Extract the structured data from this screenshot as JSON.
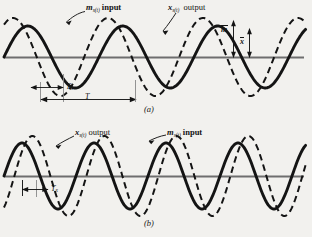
{
  "figure": {
    "background_color": "#f2f1ee",
    "ink_color": "#141414",
    "axis_color": "#6b6b6b",
    "panels": [
      {
        "id": "a",
        "caption": "(a)",
        "axis_y": 57,
        "labels": {
          "input": {
            "symbol": "m",
            "subscript": "s(t)",
            "word": "input"
          },
          "output": {
            "symbol": "x",
            "subscript": "s(t)",
            "word": "output"
          }
        },
        "measures": {
          "tx": {
            "symbol": "T",
            "subscript": "x"
          },
          "t": {
            "symbol": "T",
            "subscript": ""
          },
          "m_bar": "m",
          "x_bar": "x"
        },
        "waves": {
          "input_dashed": {
            "name": "m_s(t) input",
            "style": "dashed",
            "amplitude_px": 39,
            "period_px": 95,
            "phase_deg": 56,
            "stroke_width": 2.0
          },
          "output_solid": {
            "name": "x_s(t) output",
            "style": "solid",
            "amplitude_px": 31,
            "period_px": 95,
            "phase_deg": 0,
            "stroke_width": 2.9
          }
        }
      },
      {
        "id": "b",
        "caption": "(b)",
        "axis_y": 176,
        "labels": {
          "output": {
            "symbol": "x",
            "subscript": "s(t)",
            "word": "output"
          },
          "input": {
            "symbol": "m",
            "subscript": "s(t)",
            "word": "input"
          }
        },
        "measures": {
          "tx": {
            "symbol": "T",
            "subscript": "x"
          }
        },
        "waves": {
          "output_solid": {
            "name": "x_s(t) output",
            "style": "solid",
            "amplitude_px": 33,
            "period_px": 72,
            "phase_deg": 0,
            "stroke_width": 2.9
          },
          "input_dashed": {
            "name": "m_s(t) input",
            "style": "dashed",
            "amplitude_px": 40,
            "period_px": 72,
            "phase_deg": -52,
            "stroke_width": 2.0
          }
        }
      }
    ]
  },
  "text": {
    "a_input_sym": "m",
    "a_input_sub": "s(t)",
    "a_input_word": "input",
    "a_output_sym": "x",
    "a_output_sub": "s(t)",
    "a_output_word": "output",
    "a_tx_sym": "T",
    "a_tx_sub": "x",
    "a_t_sym": "T",
    "a_mbar": "m",
    "a_xbar": "x",
    "caption_a": "(a)",
    "b_output_sym": "x",
    "b_output_sub": "s(t)",
    "b_output_word": "output",
    "b_input_sym": "m",
    "b_input_sub": "s(t)",
    "b_input_word": "input",
    "b_tx_sym": "T",
    "b_tx_sub": "x",
    "caption_b": "(b)"
  }
}
